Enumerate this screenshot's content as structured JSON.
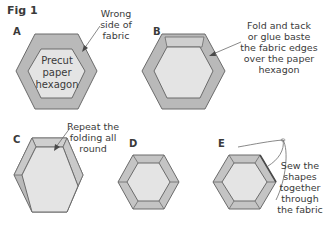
{
  "figure": {
    "title": "Fig 1"
  },
  "colors": {
    "fabric": "#b9b9b9",
    "paper": "#e4e4e4",
    "fold": "#c9c9c9",
    "outline": "#6b6b6b",
    "text": "#3a3a3a"
  },
  "panels": [
    {
      "id": "A",
      "label": "A",
      "hex_text": [
        "Precut",
        "paper",
        "hexagon"
      ],
      "note": [
        "Wrong",
        "side of",
        "fabric"
      ]
    },
    {
      "id": "B",
      "label": "B",
      "note": [
        "Fold and tack",
        "or glue baste",
        "the fabric edges",
        "over the paper",
        "hexagon"
      ]
    },
    {
      "id": "C",
      "label": "C",
      "note": [
        "Repeat the",
        "folding all",
        "round"
      ]
    },
    {
      "id": "D",
      "label": "D"
    },
    {
      "id": "E",
      "label": "E",
      "note": [
        "Sew the",
        "shapes",
        "together",
        "through",
        "the fabric"
      ]
    }
  ]
}
